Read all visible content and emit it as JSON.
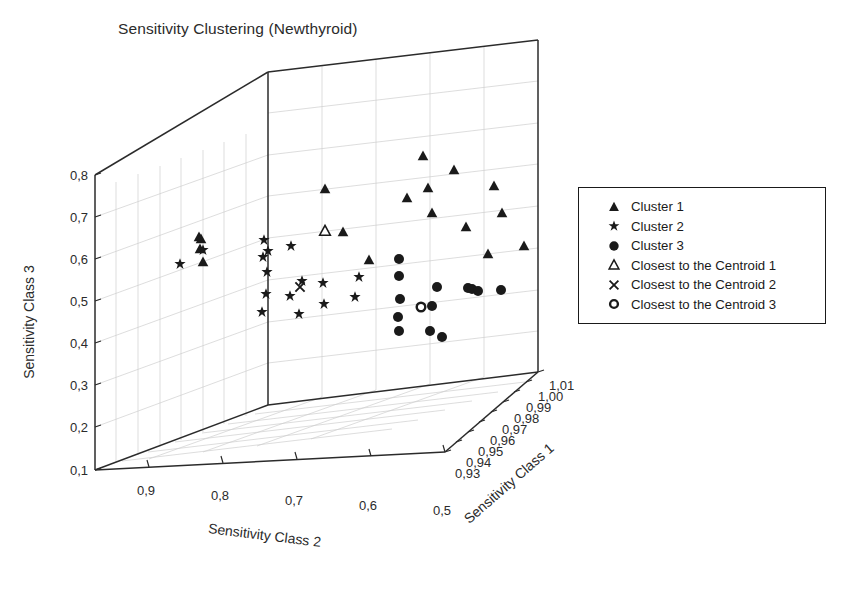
{
  "title": "Sensitivity Clustering (Newthyroid)",
  "legend": {
    "border_color": "#1a1a1a",
    "entries": [
      {
        "label": "Cluster 1",
        "marker": "filled-triangle-icon"
      },
      {
        "label": "Cluster 2",
        "marker": "filled-star-icon"
      },
      {
        "label": "Cluster 3",
        "marker": "filled-circle-icon"
      },
      {
        "label": "Closest to the Centroid 1",
        "marker": "open-triangle-icon"
      },
      {
        "label": "Closest to the Centroid 2",
        "marker": "cross-x-icon"
      },
      {
        "label": "Closest to the Centroid 3",
        "marker": "open-circle-icon"
      }
    ]
  },
  "chart_data": {
    "type": "scatter",
    "projection": "3d",
    "title": "Sensitivity Clustering (Newthyroid)",
    "grid": true,
    "legend_position": "right",
    "marker_color": "#1a1a1a",
    "axes": {
      "x": {
        "label": "Sensitivity Class 2",
        "ticks": [
          "0,9",
          "0,8",
          "0,7",
          "0,6",
          "0,5"
        ],
        "tick_values": [
          0.9,
          0.8,
          0.7,
          0.6,
          0.5
        ],
        "range": [
          0.95,
          0.5
        ],
        "reversed": true
      },
      "y": {
        "label": "Sensitivity Class 1",
        "ticks": [
          "0,93",
          "0,94",
          "0,95",
          "0,96",
          "0,97",
          "0,98",
          "0,99",
          "1,00",
          "1,01"
        ],
        "tick_values": [
          0.93,
          0.94,
          0.95,
          0.96,
          0.97,
          0.98,
          0.99,
          1.0,
          1.01
        ],
        "range": [
          0.93,
          1.01
        ]
      },
      "z": {
        "label": "Sensitivity Class 3",
        "ticks": [
          "0,1",
          "0,2",
          "0,3",
          "0,4",
          "0,5",
          "0,6",
          "0,7",
          "0,8"
        ],
        "tick_values": [
          0.1,
          0.2,
          0.3,
          0.4,
          0.5,
          0.6,
          0.7,
          0.8
        ],
        "range": [
          0.1,
          0.8
        ]
      }
    },
    "series": [
      {
        "name": "Cluster 1",
        "marker": "filled-triangle-icon",
        "points": [
          {
            "px": 199,
            "py": 237
          },
          {
            "px": 201,
            "py": 239
          },
          {
            "px": 200,
            "py": 249
          },
          {
            "px": 203,
            "py": 262
          },
          {
            "px": 325,
            "py": 231
          },
          {
            "px": 343,
            "py": 232
          },
          {
            "px": 325,
            "py": 189
          },
          {
            "px": 369,
            "py": 260
          },
          {
            "px": 407,
            "py": 198
          },
          {
            "px": 423,
            "py": 156
          },
          {
            "px": 428,
            "py": 188
          },
          {
            "px": 432,
            "py": 213
          },
          {
            "px": 454,
            "py": 170
          },
          {
            "px": 466,
            "py": 227
          },
          {
            "px": 488,
            "py": 254
          },
          {
            "px": 494,
            "py": 186
          },
          {
            "px": 502,
            "py": 213
          },
          {
            "px": 524,
            "py": 246
          }
        ]
      },
      {
        "name": "Cluster 2",
        "marker": "filled-star-icon",
        "points": [
          {
            "px": 180,
            "py": 264
          },
          {
            "px": 203,
            "py": 250
          },
          {
            "px": 264,
            "py": 240
          },
          {
            "px": 268,
            "py": 251
          },
          {
            "px": 263,
            "py": 257
          },
          {
            "px": 267,
            "py": 272
          },
          {
            "px": 291,
            "py": 246
          },
          {
            "px": 266,
            "py": 294
          },
          {
            "px": 290,
            "py": 296
          },
          {
            "px": 302,
            "py": 281
          },
          {
            "px": 323,
            "py": 283
          },
          {
            "px": 299,
            "py": 314
          },
          {
            "px": 324,
            "py": 304
          },
          {
            "px": 262,
            "py": 312
          },
          {
            "px": 355,
            "py": 297
          },
          {
            "px": 359,
            "py": 277
          }
        ]
      },
      {
        "name": "Cluster 3",
        "marker": "filled-circle-icon",
        "points": [
          {
            "px": 399,
            "py": 259
          },
          {
            "px": 399,
            "py": 276
          },
          {
            "px": 400,
            "py": 299
          },
          {
            "px": 398,
            "py": 317
          },
          {
            "px": 399,
            "py": 331
          },
          {
            "px": 430,
            "py": 331
          },
          {
            "px": 432,
            "py": 306
          },
          {
            "px": 437,
            "py": 287
          },
          {
            "px": 442,
            "py": 337
          },
          {
            "px": 468,
            "py": 288
          },
          {
            "px": 472,
            "py": 289
          },
          {
            "px": 478,
            "py": 291
          },
          {
            "px": 501,
            "py": 290
          }
        ]
      },
      {
        "name": "Closest to the Centroid 1",
        "marker": "open-triangle-icon",
        "points": [
          {
            "px": 325,
            "py": 231
          }
        ]
      },
      {
        "name": "Closest to the Centroid 2",
        "marker": "cross-x-icon",
        "points": [
          {
            "px": 300,
            "py": 287
          }
        ]
      },
      {
        "name": "Closest to the Centroid 3",
        "marker": "open-circle-icon",
        "points": [
          {
            "px": 421,
            "py": 307
          }
        ]
      }
    ]
  }
}
